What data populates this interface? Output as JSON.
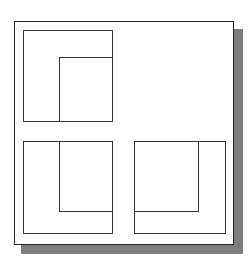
{
  "diagram": {
    "colors": {
      "stroke": "#333333",
      "frame": "#222222",
      "shadow": "#7d7d7d",
      "background": "#ffffff"
    },
    "views": [
      {
        "name": "top-left-view",
        "outer": [
          23,
          30,
          89,
          91
        ],
        "inner_lines": [
          "vertical at x=59 from y=57 to y=121",
          "horizontal at y=57 from x=59 to x=112"
        ]
      },
      {
        "name": "bottom-left-view",
        "outer": [
          23,
          141,
          89,
          92
        ],
        "inner_lines": [
          "vertical at x=59 from y=141 to y=211",
          "horizontal at y=211 from x=59 to x=112"
        ]
      },
      {
        "name": "bottom-right-view",
        "outer": [
          134,
          141,
          91,
          92
        ],
        "inner_lines": [
          "vertical at x=198 from y=141 to y=211",
          "horizontal at y=211 from x=134 to x=198"
        ]
      }
    ]
  }
}
